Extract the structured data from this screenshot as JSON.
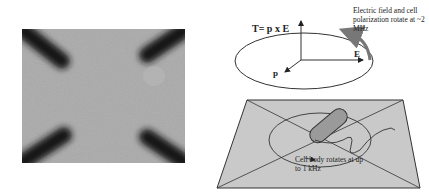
{
  "micrograph": {
    "description": "Grayscale micrograph of four dark electrode tips arranged in an X pattern around a central cell"
  },
  "diagram": {
    "torque_equation": "T= p x E",
    "field_note": "Electric field and cell polarization rotate at ~2 MHz",
    "vector_E_label": "E",
    "vector_p_label": "p",
    "rotation_note": "Cell body rotates at up to 1 kHz"
  },
  "colors": {
    "background": "#ffffff",
    "micro_bg": "#a9a9a9",
    "electrode": "#1a1a1a",
    "plane_fill": "#c8c8c8",
    "line": "#333333",
    "arrow_gray": "#777777"
  }
}
